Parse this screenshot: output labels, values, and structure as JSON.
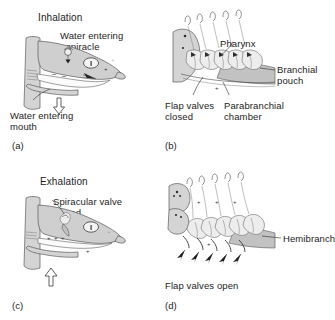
{
  "figure": {
    "background_color": "#ffffff",
    "ink_color": "#1c1c1c",
    "body_fill_color": "#d4d4d4"
  },
  "panels": [
    {
      "id": "a",
      "id_label": "(a)",
      "phase_title": "Inhalation",
      "view": "head-profile",
      "labels": [
        {
          "name": "water-entering-spiracle",
          "text": "Water entering\nspiracle"
        },
        {
          "name": "water-entering-mouth",
          "text": "Water entering\nmouth"
        }
      ],
      "symbols": {
        "pressure_marks": "minus",
        "roman_numeral": "I"
      }
    },
    {
      "id": "b",
      "id_label": "(b)",
      "phase_title": "",
      "view": "branchial-detail",
      "labels": [
        {
          "name": "pharynx",
          "text": "Pharynx"
        },
        {
          "name": "branchial-pouch",
          "text": "Branchial\npouch"
        },
        {
          "name": "flap-valves-closed",
          "text": "Flap valves\nclosed"
        },
        {
          "name": "parabranchial-chamber",
          "text": "Parabranchial\nchamber"
        }
      ],
      "symbols": {
        "pressure_marks": "plus",
        "gill_arch_count": 5
      }
    },
    {
      "id": "c",
      "id_label": "(c)",
      "phase_title": "Exhalation",
      "view": "head-profile",
      "labels": [
        {
          "name": "spiracular-valve-closed",
          "text": "Spiracular valve\nclosed"
        }
      ],
      "symbols": {
        "pressure_marks": "plus",
        "roman_numeral": "I"
      }
    },
    {
      "id": "d",
      "id_label": "(d)",
      "phase_title": "",
      "view": "branchial-detail",
      "labels": [
        {
          "name": "hemibranch",
          "text": "Hemibranch"
        },
        {
          "name": "flap-valves-open",
          "text": "Flap valves open"
        }
      ],
      "symbols": {
        "pressure_marks": "plus",
        "gill_arch_count": 5
      }
    }
  ],
  "text": {
    "inhalation": "Inhalation",
    "exhalation": "Exhalation",
    "water_entering_spiracle_l1": "Water entering",
    "water_entering_spiracle_l2": "spiracle",
    "water_entering_mouth_l1": "Water entering",
    "water_entering_mouth_l2": "mouth",
    "pharynx": "Pharynx",
    "branchial_pouch_l1": "Branchial",
    "branchial_pouch_l2": "pouch",
    "flap_valves_closed_l1": "Flap valves",
    "flap_valves_closed_l2": "closed",
    "parabranchial_l1": "Parabranchial",
    "parabranchial_l2": "chamber",
    "spiracular_valve_l1": "Spiracular valve",
    "spiracular_valve_l2": "closed",
    "hemibranch": "Hemibranch",
    "flap_valves_open": "Flap valves open",
    "panel_a": "(a)",
    "panel_b": "(b)",
    "panel_c": "(c)",
    "panel_d": "(d)",
    "roman_one": "I"
  }
}
